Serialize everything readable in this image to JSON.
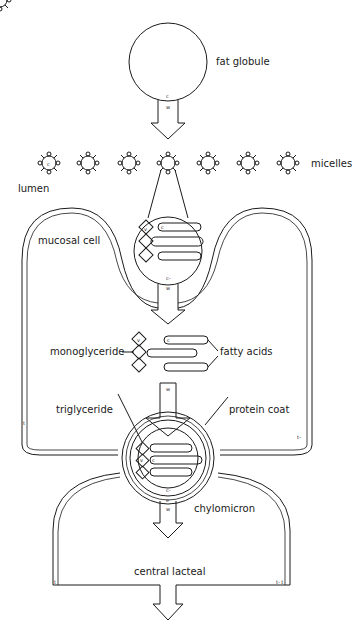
{
  "diagram": {
    "type": "fat absorption schematic",
    "labels": {
      "fat_globule": "fat globule",
      "micelles": "micelles",
      "lumen": "lumen",
      "mucosal_cell": "mucosal cell",
      "monoglyceride": "monoglyceride",
      "fatty_acids": "fatty acids",
      "triglyceride": "triglyceride",
      "protein_coat": "protein coat",
      "chylomicron": "chylomicron",
      "central_lacteal": "central lacteal"
    },
    "small_marks": {
      "arrow1_top": "c",
      "arrow1_bottom": "w",
      "micelle_inner": "c",
      "zoom_diamond": "v",
      "zoom_chain": "c",
      "arrow2_top": "c-",
      "arrow2_bottom": "w",
      "mono_diamond": "v",
      "fa_chain": "c",
      "arrow3": "w",
      "tri_diamond": "v",
      "tri_chain": "c",
      "arrow4_top": "c-",
      "arrow4_mid": "e",
      "arrow4_bottom": "w",
      "cell_left_t": "t",
      "cell_right_t": "t-",
      "lacteal_left_t": "t",
      "lacteal_right_t": "t- t"
    },
    "micelle_count": 7,
    "colors": {
      "ink": "#1a1a1a",
      "background": "#ffffff"
    }
  }
}
